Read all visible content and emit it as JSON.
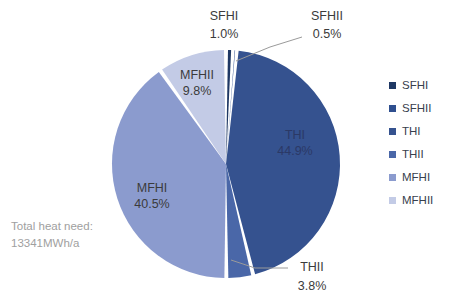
{
  "chart_data": {
    "type": "pie",
    "title": "",
    "categories": [
      "SFHI",
      "SFHII",
      "THI",
      "THII",
      "MFHI",
      "MFHII"
    ],
    "values": [
      1.0,
      0.5,
      44.9,
      3.8,
      40.5,
      9.8
    ],
    "value_labels": [
      "1.0%",
      "0.5%",
      "44.9%",
      "3.8%",
      "40.5%",
      "9.8%"
    ],
    "unit": "%",
    "colors": [
      "#1f3864",
      "#2f4f8f",
      "#35528f",
      "#4a67a8",
      "#8b9bce",
      "#c3cbe6"
    ],
    "legend_position": "right",
    "grid": false,
    "start_angle_deg": 0,
    "annotation_lines": [
      "Total heat need:",
      "13341MWh/a"
    ],
    "slices": [
      {
        "name": "SFHI",
        "value": 1.0,
        "label": "SFHI",
        "pct": "1.0%",
        "color": "#1f3864",
        "label_placement": "outside"
      },
      {
        "name": "SFHII",
        "value": 0.5,
        "label": "SFHII",
        "pct": "0.5%",
        "color": "#2f4f8f",
        "label_placement": "outside"
      },
      {
        "name": "THI",
        "value": 44.9,
        "label": "THI",
        "pct": "44.9%",
        "color": "#35528f",
        "label_placement": "inside"
      },
      {
        "name": "THII",
        "value": 3.8,
        "label": "THII",
        "pct": "3.8%",
        "color": "#4a67a8",
        "label_placement": "outside"
      },
      {
        "name": "MFHI",
        "value": 40.5,
        "label": "MFHI",
        "pct": "40.5%",
        "color": "#8b9bce",
        "label_placement": "inside"
      },
      {
        "name": "MFHII",
        "value": 9.8,
        "label": "MFHII",
        "pct": "9.8%",
        "color": "#c3cbe6",
        "label_placement": "inside"
      }
    ]
  },
  "legend": {
    "items": [
      {
        "label": "SFHI",
        "color": "#1f3864"
      },
      {
        "label": "SFHII",
        "color": "#2f4f8f"
      },
      {
        "label": "THI",
        "color": "#35528f"
      },
      {
        "label": "THII",
        "color": "#4a67a8"
      },
      {
        "label": "MFHI",
        "color": "#8b9bce"
      },
      {
        "label": "MFHII",
        "color": "#c3cbe6"
      }
    ]
  },
  "annotation": {
    "line1": "Total heat need:",
    "line2": "13341MWh/a"
  },
  "labels": {
    "sfhi_name": "SFHI",
    "sfhi_pct": "1.0%",
    "sfhii_name": "SFHII",
    "sfhii_pct": "0.5%",
    "thi_name": "THI",
    "thi_pct": "44.9%",
    "thii_name": "THII",
    "thii_pct": "3.8%",
    "mfhi_name": "MFHI",
    "mfhi_pct": "40.5%",
    "mfhii_name": "MFHII",
    "mfhii_pct": "9.8%"
  }
}
